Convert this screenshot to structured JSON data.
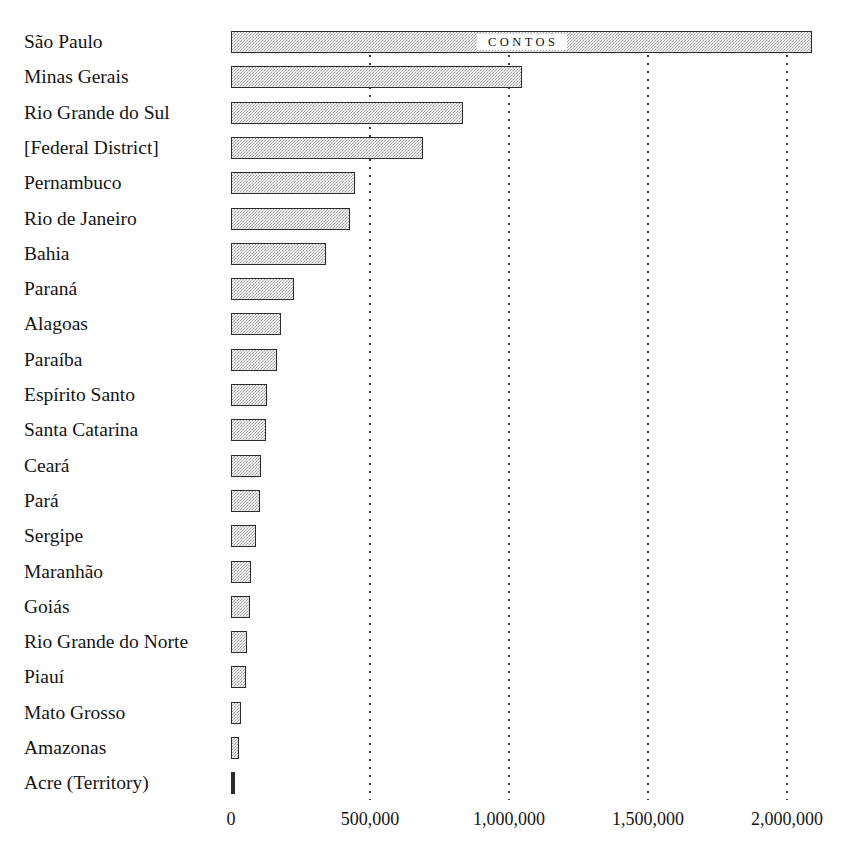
{
  "chart_data": {
    "type": "bar",
    "orientation": "horizontal",
    "title": "",
    "subtitle": "",
    "xlabel": "",
    "ylabel": "",
    "unit_caption": "CONTOS",
    "xlim": [
      0,
      2100000
    ],
    "grid": true,
    "legend": null,
    "xticks": [
      {
        "value": 0,
        "label": "0"
      },
      {
        "value": 500000,
        "label": "500,000"
      },
      {
        "value": 1000000,
        "label": "1,000,000"
      },
      {
        "value": 1500000,
        "label": "1,500,000"
      },
      {
        "value": 2000000,
        "label": "2,000,000"
      }
    ],
    "categories": [
      "São Paulo",
      "Minas Gerais",
      "Rio Grande do Sul",
      "[Federal District]",
      "Pernambuco",
      "Rio de Janeiro",
      "Bahia",
      "Paraná",
      "Alagoas",
      "Paraíba",
      "Espírito Santo",
      "Santa Catarina",
      "Ceará",
      "Pará",
      "Sergipe",
      "Maranhão",
      "Goiás",
      "Rio Grande do Norte",
      "Piauí",
      "Mato Grosso",
      "Amazonas",
      "Acre (Territory)"
    ],
    "values": [
      2090000,
      1047000,
      835000,
      691000,
      446000,
      428000,
      342000,
      227000,
      180000,
      165000,
      130000,
      126000,
      108000,
      104000,
      90000,
      72000,
      68000,
      58000,
      54000,
      36000,
      29000,
      14000
    ]
  }
}
